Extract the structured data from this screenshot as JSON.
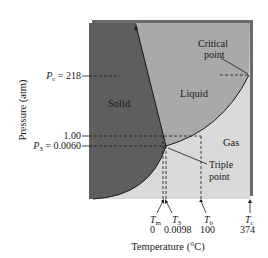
{
  "diagram": {
    "colors": {
      "solid": "#5e5e5e",
      "liquid": "#a9a9a9",
      "gas": "#d9d9d9",
      "shadow": "#6a6a6a",
      "line": "#1a1a1a"
    },
    "regions": {
      "solid": "Solid",
      "liquid": "Liquid",
      "gas": "Gas"
    },
    "annotations": {
      "critical_point_line1": "Critical",
      "critical_point_line2": "point",
      "triple_point_line1": "Triple",
      "triple_point_line2": "point"
    },
    "y_axis": {
      "label": "Pressure (atm)",
      "ticks": [
        {
          "symbol": "P",
          "subscript": "c",
          "text": " = 218"
        },
        {
          "symbol": "",
          "subscript": "",
          "text": "1.00"
        },
        {
          "symbol": "P",
          "subscript": "3",
          "text": " = 0.0060"
        }
      ]
    },
    "x_axis": {
      "label": "Temperature (°C)",
      "ticks": [
        {
          "symbol": "T",
          "subscript": "m",
          "value": "0"
        },
        {
          "symbol": "T",
          "subscript": "3",
          "value": "0.0098"
        },
        {
          "symbol": "T",
          "subscript": "b",
          "value": "100"
        },
        {
          "symbol": "T",
          "subscript": "c",
          "value": "374"
        }
      ]
    }
  }
}
